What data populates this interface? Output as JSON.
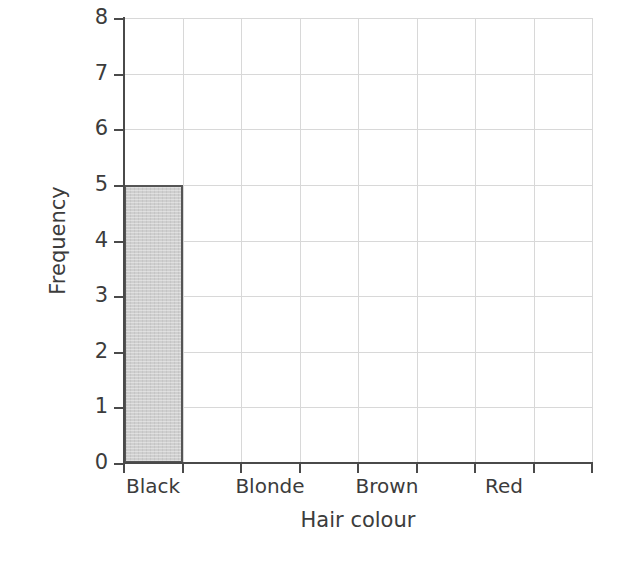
{
  "chart_data": {
    "type": "bar",
    "title": "",
    "xlabel": "Hair colour",
    "ylabel": "Frequency",
    "categories": [
      "Black",
      "Blonde",
      "Brown",
      "Red"
    ],
    "values": [
      5,
      0,
      0,
      0
    ],
    "ylim": [
      0,
      8
    ],
    "yticks": [
      0,
      1,
      2,
      3,
      4,
      5,
      6,
      7,
      8
    ],
    "ytick_labels": [
      "0",
      "1",
      "2",
      "3",
      "4",
      "5",
      "6",
      "7",
      "8"
    ],
    "grid": true,
    "grid_color": "#d8d8d8",
    "legend": "none",
    "x_tick_count": 9,
    "x_slot_count": 8,
    "category_slots": [
      0,
      2,
      4,
      6
    ],
    "bar_fill_color": "#cfcfcf",
    "bar_edge_color": "#555555",
    "axis_color": "#4a4a4a",
    "background_color": "#ffffff",
    "series": [
      {
        "name": "Frequency",
        "values": [
          5,
          0,
          0,
          0
        ]
      }
    ],
    "annotations": []
  }
}
